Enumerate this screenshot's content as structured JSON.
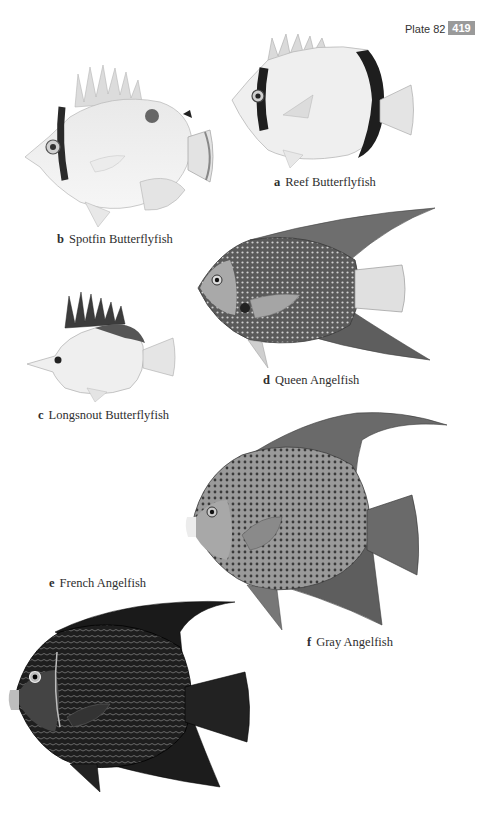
{
  "header": {
    "plate_label": "Plate 82",
    "page_number": "419",
    "badge_color": "#9a9a9a"
  },
  "figures": [
    {
      "letter": "a",
      "name": "Reef Butterflyfish"
    },
    {
      "letter": "b",
      "name": "Spotfin Butterflyfish"
    },
    {
      "letter": "c",
      "name": "Longsnout Butterflyfish"
    },
    {
      "letter": "d",
      "name": "Queen Angelfish"
    },
    {
      "letter": "e",
      "name": "French Angelfish"
    },
    {
      "letter": "f",
      "name": "Gray Angelfish"
    }
  ]
}
